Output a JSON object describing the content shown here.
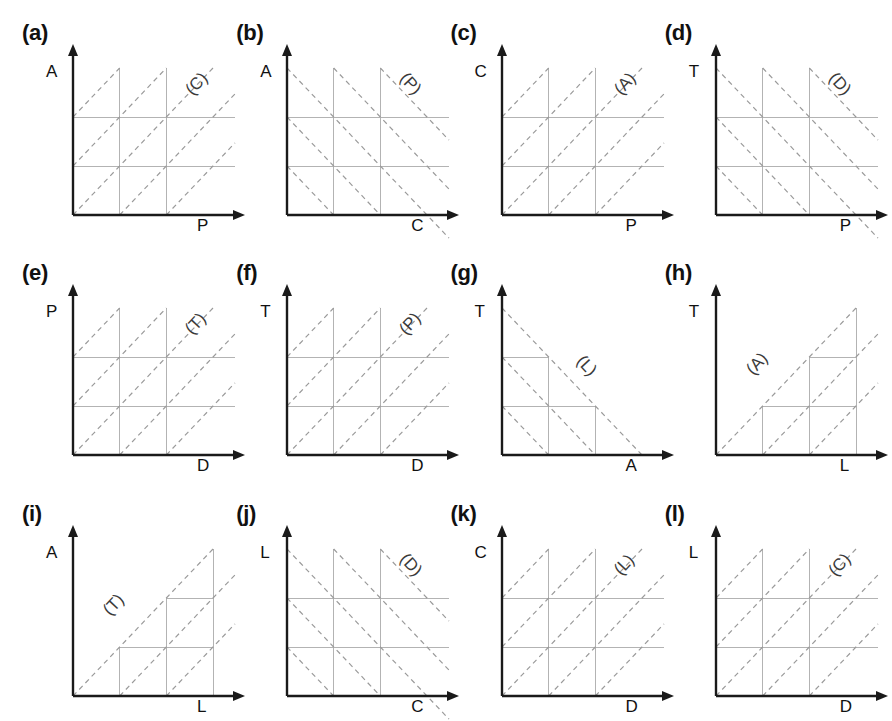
{
  "figure": {
    "type": "schematic-grid-diagram",
    "rows": 3,
    "columns": 4,
    "panel_count": 12,
    "colors": {
      "axis": "#1a1a1a",
      "grid": "#b3b3b3",
      "diagonal": "#9a9a9a",
      "text": "#111111",
      "inner_label": "#3a3a3a",
      "background": "#ffffff"
    }
  },
  "panels": [
    {
      "id": "a",
      "tag": "(a)",
      "y_axis": "A",
      "x_axis": "P",
      "inner_label": "(C)",
      "diagonal_slope": "positive",
      "grid_style": "full",
      "label_pos": {
        "left": 112,
        "top": 6
      }
    },
    {
      "id": "b",
      "tag": "(b)",
      "y_axis": "A",
      "x_axis": "C",
      "inner_label": "(P)",
      "diagonal_slope": "negative",
      "grid_style": "full",
      "label_pos": {
        "left": 112,
        "top": 6
      }
    },
    {
      "id": "c",
      "tag": "(c)",
      "y_axis": "C",
      "x_axis": "P",
      "inner_label": "(A)",
      "diagonal_slope": "positive",
      "grid_style": "full",
      "label_pos": {
        "left": 112,
        "top": 6
      }
    },
    {
      "id": "d",
      "tag": "(d)",
      "y_axis": "T",
      "x_axis": "P",
      "inner_label": "(D)",
      "diagonal_slope": "negative",
      "grid_style": "full",
      "label_pos": {
        "left": 112,
        "top": 6
      }
    },
    {
      "id": "e",
      "tag": "(e)",
      "y_axis": "P",
      "x_axis": "D",
      "inner_label": "(T)",
      "diagonal_slope": "positive",
      "grid_style": "full",
      "label_pos": {
        "left": 112,
        "top": 6
      }
    },
    {
      "id": "f",
      "tag": "(f)",
      "y_axis": "T",
      "x_axis": "D",
      "inner_label": "(P)",
      "diagonal_slope": "positive",
      "grid_style": "full",
      "label_pos": {
        "left": 112,
        "top": 6
      }
    },
    {
      "id": "g",
      "tag": "(g)",
      "y_axis": "T",
      "x_axis": "A",
      "inner_label": "(L)",
      "diagonal_slope": "negative",
      "grid_style": "staircase-descending",
      "label_pos": {
        "left": 74,
        "top": 48
      }
    },
    {
      "id": "h",
      "tag": "(h)",
      "y_axis": "T",
      "x_axis": "L",
      "inner_label": "(A)",
      "diagonal_slope": "positive",
      "grid_style": "staircase-ascending",
      "label_pos": {
        "left": 30,
        "top": 46
      }
    },
    {
      "id": "i",
      "tag": "(i)",
      "y_axis": "A",
      "x_axis": "L",
      "inner_label": "(T)",
      "diagonal_slope": "positive",
      "grid_style": "staircase-ascending",
      "label_pos": {
        "left": 30,
        "top": 46
      }
    },
    {
      "id": "j",
      "tag": "(j)",
      "y_axis": "L",
      "x_axis": "C",
      "inner_label": "(D)",
      "diagonal_slope": "negative",
      "grid_style": "full",
      "label_pos": {
        "left": 112,
        "top": 6
      }
    },
    {
      "id": "k",
      "tag": "(k)",
      "y_axis": "C",
      "x_axis": "D",
      "inner_label": "(L)",
      "diagonal_slope": "positive",
      "grid_style": "full",
      "label_pos": {
        "left": 112,
        "top": 6
      }
    },
    {
      "id": "l",
      "tag": "(l)",
      "y_axis": "L",
      "x_axis": "D",
      "inner_label": "(C)",
      "diagonal_slope": "positive",
      "grid_style": "full",
      "label_pos": {
        "left": 112,
        "top": 6
      }
    }
  ]
}
